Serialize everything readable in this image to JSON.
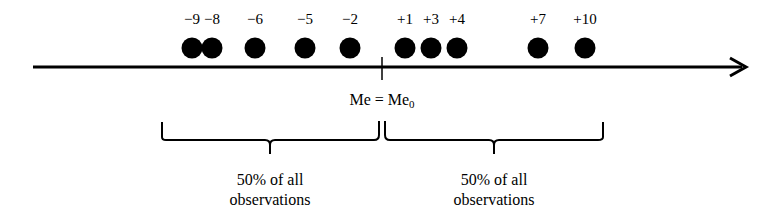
{
  "diagram": {
    "title": "",
    "axis": {
      "x_start": 33,
      "x_end": 748,
      "y": 67,
      "color": "#000000"
    },
    "median_tick_x": 382,
    "median_label": {
      "main": "Me = Me",
      "subscript": "0"
    },
    "points": [
      {
        "label": "−9",
        "value": -9,
        "x": 192
      },
      {
        "label": "−8",
        "value": -8,
        "x": 212
      },
      {
        "label": "−6",
        "value": -6,
        "x": 255
      },
      {
        "label": "−5",
        "value": -5,
        "x": 305
      },
      {
        "label": "−2",
        "value": -2,
        "x": 350
      },
      {
        "label": "+1",
        "value": 1,
        "x": 405
      },
      {
        "label": "+3",
        "value": 3,
        "x": 431
      },
      {
        "label": "+4",
        "value": 4,
        "x": 457
      },
      {
        "label": "+7",
        "value": 7,
        "x": 538
      },
      {
        "label": "+10",
        "value": 10,
        "x": 585
      }
    ],
    "groups": [
      {
        "line1": "50% of all",
        "line2": "observations",
        "x": 270
      },
      {
        "line1": "50% of all",
        "line2": "observations",
        "x": 494
      }
    ]
  }
}
